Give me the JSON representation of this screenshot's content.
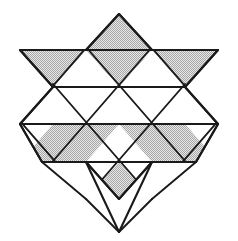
{
  "figure": {
    "title": "Hexagram star tiling",
    "background_color": "#ffffff",
    "line_color": "#1a1a1a",
    "shade_color": "#c8c8c8",
    "shade_pattern": "dotted-checker-gray",
    "canvas": {
      "width": 238,
      "height": 241
    }
  },
  "geometry": {
    "grid": {
      "horizontal_lines_y": [
        50,
        87,
        124,
        162
      ],
      "apex_top_y": 14,
      "apex_bottom_y": 232,
      "left_x": 20,
      "right_x": 218,
      "center_x": 119,
      "cell_half_width": 33,
      "row_height": 37
    },
    "vertices": {
      "top_apex": [
        119,
        14
      ],
      "bottom_apex": [
        119,
        232
      ],
      "top_left_corner": [
        20,
        50
      ],
      "top_right_corner": [
        218,
        50
      ],
      "bottom_left_corner": [
        42,
        162
      ],
      "bottom_right_corner": [
        196,
        162
      ],
      "mid_left_point": [
        20,
        50
      ],
      "mid_right_point": [
        218,
        50
      ]
    }
  },
  "tiles": {
    "shaded": [
      {
        "name": "top-rhombus",
        "points": "119,14 152,50 119,87 86,50",
        "position": "top star point"
      },
      {
        "name": "upper-left-parallelogram",
        "points": "20,50 86,50 53,87 -13,87",
        "position": "upper left arm",
        "clip": "20,50 86,50 53,87 -13,87"
      },
      {
        "name": "upper-right-parallelogram",
        "points": "152,50 218,50 251,87 185,87",
        "position": "upper right arm"
      },
      {
        "name": "lower-left-parallelogram",
        "points": "53,124 119,124 86,162 20,162",
        "position": "lower left arm"
      },
      {
        "name": "lower-right-parallelogram",
        "points": "119,124 185,124 218,162 152,162",
        "position": "lower right arm"
      },
      {
        "name": "bottom-rhombus",
        "points": "119,162 152,199 119,232 86,199",
        "position": "bottom star point"
      }
    ],
    "plain_count": 18,
    "shaded_count": 6
  },
  "paths": {
    "star_outline": "M119,14 L152,50 L218,50 L185,87 L218,124 L152,124 L196,162 L152,162 L119,199 L86,162 L42,162 L86,124 L20,124 L53,87 L20,50 L86,50 Z",
    "horizontal_row_1": "M20,50 L218,50",
    "horizontal_row_2": "M20,87 L218,87",
    "horizontal_row_3": "M20,124 L218,124",
    "horizontal_row_4": "M42,162 L196,162"
  }
}
